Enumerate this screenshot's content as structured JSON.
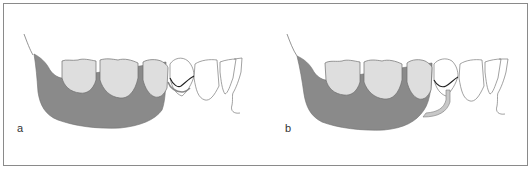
{
  "figure": {
    "panels": [
      {
        "id": "a",
        "label": "a",
        "description": "Partial denture base with clasp on anterior tooth (circumferential)"
      },
      {
        "id": "b",
        "label": "b",
        "description": "Partial denture base with bar clasp approaching from gingival side"
      }
    ],
    "colors": {
      "denture_base": "#8a8a8a",
      "artificial_teeth": "#dedede",
      "natural_teeth": "#ffffff",
      "outline": "#7a7a7a",
      "clasp": "#222222",
      "bar_arm": "#c8c8c8",
      "frame_border": "#8a8a8a"
    }
  }
}
